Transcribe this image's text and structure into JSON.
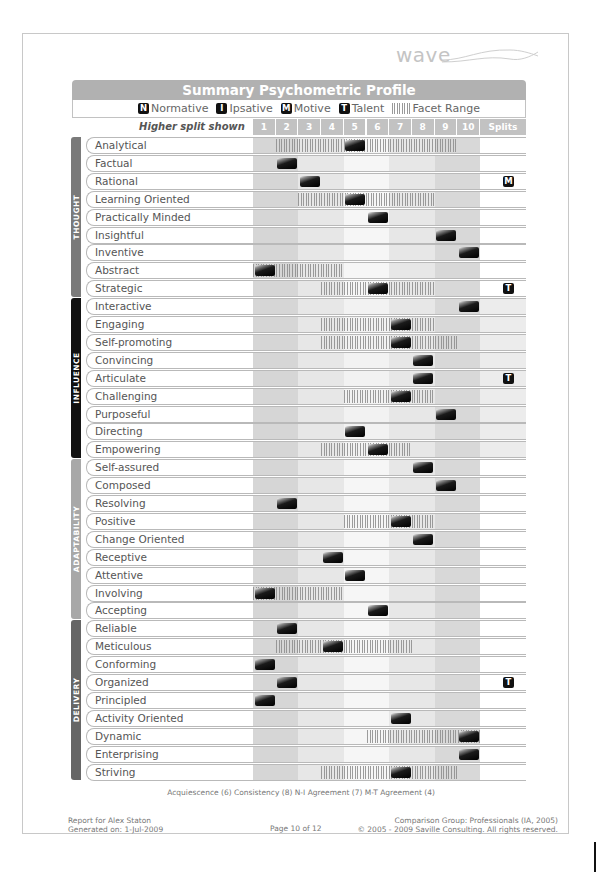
{
  "logo": {
    "text": "wave"
  },
  "title": "Summary Psychometric Profile",
  "legend": [
    {
      "glyph": "N",
      "label": "Normative",
      "icon": "normative-icon"
    },
    {
      "glyph": "I",
      "label": "Ipsative",
      "icon": "ipsative-icon"
    },
    {
      "glyph": "M",
      "label": "Motive",
      "icon": "motive-icon"
    },
    {
      "glyph": "T",
      "label": "Talent",
      "icon": "talent-icon"
    },
    {
      "glyph": "",
      "label": "Facet Range",
      "icon": "facet-range-icon"
    }
  ],
  "header": {
    "higher_split": "Higher split shown",
    "columns": [
      "1",
      "2",
      "3",
      "4",
      "5",
      "6",
      "7",
      "8",
      "9",
      "10"
    ],
    "splits": "Splits"
  },
  "colors": {
    "thought": "#7a7a7a",
    "influence": "#111111",
    "adaptability": "#a8a8a8",
    "delivery": "#666666",
    "title_bar": "#b1b1b1"
  },
  "sections": [
    {
      "name": "THOUGHT",
      "rows": [
        {
          "label": "Analytical",
          "score": 5,
          "range": [
            2,
            9
          ],
          "split": ""
        },
        {
          "label": "Factual",
          "score": 2,
          "range": null,
          "split": ""
        },
        {
          "label": "Rational",
          "score": 3,
          "range": null,
          "split": "M"
        },
        {
          "label": "Learning Oriented",
          "score": 5,
          "range": [
            3,
            8
          ],
          "split": ""
        },
        {
          "label": "Practically Minded",
          "score": 6,
          "range": null,
          "split": ""
        },
        {
          "label": "Insightful",
          "score": 9,
          "range": null,
          "split": ""
        },
        {
          "label": "Inventive",
          "score": 10,
          "range": null,
          "split": ""
        },
        {
          "label": "Abstract",
          "score": 1,
          "range": [
            1,
            4
          ],
          "split": ""
        },
        {
          "label": "Strategic",
          "score": 6,
          "range": [
            4,
            8
          ],
          "split": "T"
        }
      ]
    },
    {
      "name": "INFLUENCE",
      "rows": [
        {
          "label": "Interactive",
          "score": 10,
          "range": null,
          "split": ""
        },
        {
          "label": "Engaging",
          "score": 7,
          "range": [
            4,
            8
          ],
          "split": ""
        },
        {
          "label": "Self-promoting",
          "score": 7,
          "range": [
            4,
            9
          ],
          "split": ""
        },
        {
          "label": "Convincing",
          "score": 8,
          "range": null,
          "split": ""
        },
        {
          "label": "Articulate",
          "score": 8,
          "range": null,
          "split": "T"
        },
        {
          "label": "Challenging",
          "score": 7,
          "range": [
            5,
            8
          ],
          "split": ""
        },
        {
          "label": "Purposeful",
          "score": 9,
          "range": null,
          "split": ""
        },
        {
          "label": "Directing",
          "score": 5,
          "range": null,
          "split": ""
        },
        {
          "label": "Empowering",
          "score": 6,
          "range": [
            4,
            7
          ],
          "split": ""
        }
      ]
    },
    {
      "name": "ADAPTABILITY",
      "rows": [
        {
          "label": "Self-assured",
          "score": 8,
          "range": null,
          "split": ""
        },
        {
          "label": "Composed",
          "score": 9,
          "range": null,
          "split": ""
        },
        {
          "label": "Resolving",
          "score": 2,
          "range": null,
          "split": ""
        },
        {
          "label": "Positive",
          "score": 7,
          "range": [
            5,
            8
          ],
          "split": ""
        },
        {
          "label": "Change Oriented",
          "score": 8,
          "range": null,
          "split": ""
        },
        {
          "label": "Receptive",
          "score": 4,
          "range": null,
          "split": ""
        },
        {
          "label": "Attentive",
          "score": 5,
          "range": null,
          "split": ""
        },
        {
          "label": "Involving",
          "score": 1,
          "range": [
            1,
            4
          ],
          "split": ""
        },
        {
          "label": "Accepting",
          "score": 6,
          "range": null,
          "split": ""
        }
      ]
    },
    {
      "name": "DELIVERY",
      "rows": [
        {
          "label": "Reliable",
          "score": 2,
          "range": null,
          "split": ""
        },
        {
          "label": "Meticulous",
          "score": 4,
          "range": [
            2,
            7
          ],
          "split": ""
        },
        {
          "label": "Conforming",
          "score": 1,
          "range": null,
          "split": ""
        },
        {
          "label": "Organized",
          "score": 2,
          "range": null,
          "split": "T"
        },
        {
          "label": "Principled",
          "score": 1,
          "range": null,
          "split": ""
        },
        {
          "label": "Activity Oriented",
          "score": 7,
          "range": null,
          "split": ""
        },
        {
          "label": "Dynamic",
          "score": 10,
          "range": [
            6,
            10
          ],
          "split": ""
        },
        {
          "label": "Enterprising",
          "score": 10,
          "range": null,
          "split": ""
        },
        {
          "label": "Striving",
          "score": 7,
          "range": [
            4,
            9
          ],
          "split": ""
        }
      ]
    }
  ],
  "footer": {
    "checks": "Acquiescence (6)  Consistency (8)  N-I Agreement (7)  M-T Agreement (4)",
    "report_for": "Report for Alex Staton",
    "generated": "Generated on: 1-Jul-2009",
    "page": "Page 10 of 12",
    "comparison": "Comparison Group: Professionals (IA, 2005)",
    "copyright": "© 2005 - 2009 Saville Consulting. All rights reserved."
  }
}
